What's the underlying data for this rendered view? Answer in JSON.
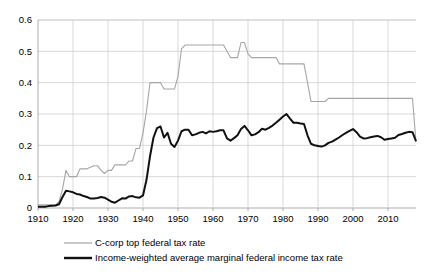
{
  "chart_data": {
    "type": "line",
    "title": "",
    "xlabel": "",
    "ylabel": "",
    "xlim": [
      1910,
      2018
    ],
    "ylim": [
      0,
      0.6
    ],
    "grid": true,
    "legend_position": "bottom",
    "xticks": [
      1910,
      1920,
      1930,
      1940,
      1950,
      1960,
      1970,
      1980,
      1990,
      2000,
      2010
    ],
    "yticks": [
      0,
      0.1,
      0.2,
      0.3,
      0.4,
      0.5,
      0.6
    ],
    "ytick_labels": [
      "0",
      "0.1",
      "0.2",
      "0.3",
      "0.4",
      "0.5",
      "0.6"
    ],
    "xtick_labels": [
      "1910",
      "1920",
      "1930",
      "1940",
      "1950",
      "1960",
      "1970",
      "1980",
      "1990",
      "2000",
      "2010"
    ],
    "series": [
      {
        "name": "C-corp top federal tax rate",
        "color": "#a6a6a6",
        "width": 1.1,
        "x": [
          1910,
          1911,
          1912,
          1913,
          1914,
          1915,
          1916,
          1917,
          1918,
          1919,
          1920,
          1921,
          1922,
          1923,
          1924,
          1925,
          1926,
          1927,
          1928,
          1929,
          1930,
          1931,
          1932,
          1933,
          1934,
          1935,
          1936,
          1937,
          1938,
          1939,
          1940,
          1941,
          1942,
          1943,
          1944,
          1945,
          1946,
          1947,
          1948,
          1949,
          1950,
          1951,
          1952,
          1953,
          1954,
          1955,
          1956,
          1957,
          1958,
          1959,
          1960,
          1961,
          1962,
          1963,
          1964,
          1965,
          1966,
          1967,
          1968,
          1969,
          1970,
          1971,
          1972,
          1973,
          1974,
          1975,
          1976,
          1977,
          1978,
          1979,
          1980,
          1981,
          1982,
          1983,
          1984,
          1985,
          1986,
          1987,
          1988,
          1989,
          1990,
          1991,
          1992,
          1993,
          1994,
          1995,
          1996,
          1997,
          1998,
          1999,
          2000,
          2001,
          2002,
          2003,
          2004,
          2005,
          2006,
          2007,
          2008,
          2009,
          2010,
          2011,
          2012,
          2013,
          2014,
          2015,
          2016,
          2017,
          2018
        ],
        "y": [
          0.01,
          0.01,
          0.01,
          0.01,
          0.01,
          0.01,
          0.02,
          0.06,
          0.12,
          0.1,
          0.1,
          0.1,
          0.125,
          0.125,
          0.125,
          0.13,
          0.135,
          0.135,
          0.12,
          0.11,
          0.12,
          0.12,
          0.1375,
          0.1375,
          0.1375,
          0.1375,
          0.15,
          0.15,
          0.19,
          0.19,
          0.24,
          0.31,
          0.4,
          0.4,
          0.4,
          0.4,
          0.38,
          0.38,
          0.38,
          0.38,
          0.42,
          0.5075,
          0.52,
          0.52,
          0.52,
          0.52,
          0.52,
          0.52,
          0.52,
          0.52,
          0.52,
          0.52,
          0.52,
          0.52,
          0.5,
          0.48,
          0.48,
          0.48,
          0.528,
          0.528,
          0.492,
          0.48,
          0.48,
          0.48,
          0.48,
          0.48,
          0.48,
          0.48,
          0.48,
          0.46,
          0.46,
          0.46,
          0.46,
          0.46,
          0.46,
          0.46,
          0.46,
          0.4,
          0.34,
          0.34,
          0.34,
          0.34,
          0.34,
          0.35,
          0.35,
          0.35,
          0.35,
          0.35,
          0.35,
          0.35,
          0.35,
          0.35,
          0.35,
          0.35,
          0.35,
          0.35,
          0.35,
          0.35,
          0.35,
          0.35,
          0.35,
          0.35,
          0.35,
          0.35,
          0.35,
          0.35,
          0.35,
          0.35,
          0.21
        ]
      },
      {
        "name": "Income-weighted average marginal federal income tax rate",
        "color": "#111111",
        "width": 2.0,
        "x": [
          1910,
          1911,
          1912,
          1913,
          1914,
          1915,
          1916,
          1917,
          1918,
          1919,
          1920,
          1921,
          1922,
          1923,
          1924,
          1925,
          1926,
          1927,
          1928,
          1929,
          1930,
          1931,
          1932,
          1933,
          1934,
          1935,
          1936,
          1937,
          1938,
          1939,
          1940,
          1941,
          1942,
          1943,
          1944,
          1945,
          1946,
          1947,
          1948,
          1949,
          1950,
          1951,
          1952,
          1953,
          1954,
          1955,
          1956,
          1957,
          1958,
          1959,
          1960,
          1961,
          1962,
          1963,
          1964,
          1965,
          1966,
          1967,
          1968,
          1969,
          1970,
          1971,
          1972,
          1973,
          1974,
          1975,
          1976,
          1977,
          1978,
          1979,
          1980,
          1981,
          1982,
          1983,
          1984,
          1985,
          1986,
          1987,
          1988,
          1989,
          1990,
          1991,
          1992,
          1993,
          1994,
          1995,
          1996,
          1997,
          1998,
          1999,
          2000,
          2001,
          2002,
          2003,
          2004,
          2005,
          2006,
          2007,
          2008,
          2009,
          2010,
          2011,
          2012,
          2013,
          2014,
          2015,
          2016,
          2017,
          2018
        ],
        "y": [
          0.004,
          0.004,
          0.004,
          0.006,
          0.007,
          0.008,
          0.012,
          0.035,
          0.055,
          0.053,
          0.05,
          0.045,
          0.043,
          0.038,
          0.035,
          0.03,
          0.03,
          0.032,
          0.035,
          0.033,
          0.027,
          0.02,
          0.017,
          0.024,
          0.031,
          0.03,
          0.037,
          0.038,
          0.034,
          0.033,
          0.04,
          0.09,
          0.165,
          0.225,
          0.255,
          0.26,
          0.225,
          0.24,
          0.205,
          0.195,
          0.215,
          0.245,
          0.25,
          0.25,
          0.232,
          0.235,
          0.24,
          0.243,
          0.238,
          0.245,
          0.243,
          0.245,
          0.248,
          0.248,
          0.222,
          0.215,
          0.223,
          0.232,
          0.252,
          0.262,
          0.248,
          0.232,
          0.235,
          0.242,
          0.253,
          0.25,
          0.256,
          0.263,
          0.272,
          0.282,
          0.292,
          0.3,
          0.285,
          0.272,
          0.272,
          0.27,
          0.268,
          0.232,
          0.205,
          0.2,
          0.198,
          0.196,
          0.2,
          0.208,
          0.212,
          0.218,
          0.225,
          0.233,
          0.24,
          0.246,
          0.252,
          0.242,
          0.228,
          0.222,
          0.223,
          0.226,
          0.228,
          0.23,
          0.226,
          0.218,
          0.22,
          0.222,
          0.224,
          0.233,
          0.236,
          0.24,
          0.243,
          0.242,
          0.213
        ]
      }
    ],
    "legend": [
      {
        "label": "C-corp top federal tax rate",
        "color": "#a6a6a6",
        "style": "thin"
      },
      {
        "label": "Income-weighted average marginal federal income tax rate",
        "color": "#111111",
        "style": "thick"
      }
    ]
  }
}
